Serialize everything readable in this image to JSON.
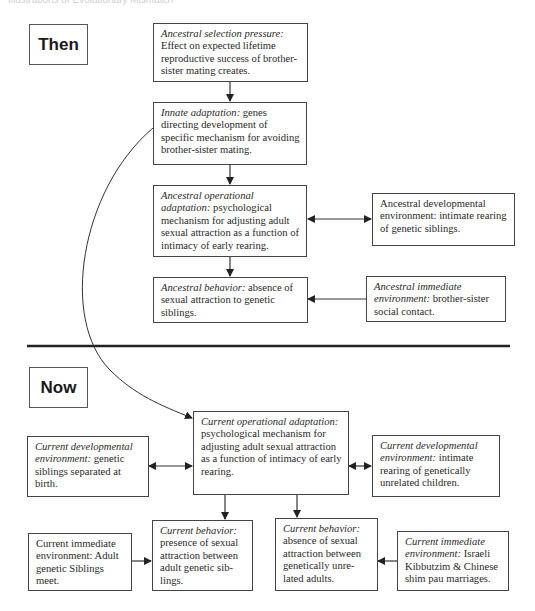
{
  "caption": "Illustrations of Evolutionary Mismatch",
  "then_label": "Then",
  "now_label": "Now",
  "then": {
    "selection_pressure": {
      "title": "Ancestral selection pressure",
      "sep": ":",
      "text": " Effect on expected lifetime reproductive success of brother-sister mating creates."
    },
    "innate_adaptation": {
      "title": "Innate adaptation",
      "sep": ":",
      "text": " genes directing development of specific mechanism for avoiding brother-sister mating."
    },
    "operational_adaptation": {
      "title": "Ancestral operational adaptation",
      "sep": ":",
      "text": " psychological mechanism for adjusting adult sexual attraction as a function of intimacy of early rearing."
    },
    "developmental_environment": {
      "title": "",
      "sep": "",
      "text": "Ancestral developmental environment: intimate rearing of genetic siblings."
    },
    "behavior": {
      "title": "Ancestral behavior",
      "sep": ":",
      "text": " absence of sexual attraction to genetic siblings."
    },
    "immediate_environment": {
      "title": "Ancestral immediate environment",
      "sep": ":",
      "text": " brother-sister social contact."
    }
  },
  "now": {
    "operational_adaptation": {
      "title": "Current operational adaptation",
      "sep": ":",
      "text": " psychological mechanism for adjusting adult sexual attraction as a function of intimacy of early rearing."
    },
    "developmental_environment_left": {
      "title": "Current developmental environment",
      "sep": ":",
      "text": " genetic siblings separated at birth."
    },
    "developmental_environment_right": {
      "title": "Current developmental environment:",
      "sep": "",
      "text": " intimate rearing of genetically unrelated children."
    },
    "behavior_left": {
      "title": "Current behavior",
      "sep": ":",
      "text": " presence of sexual attraction between adult genetic sib-lings."
    },
    "behavior_right": {
      "title": "Current behavior:",
      "sep": "",
      "text": " absence of sexual attraction between genetically unre-lated adults."
    },
    "immediate_environment_left": {
      "title": "",
      "sep": "",
      "text": "Current immediate environment: Adult genetic Siblings meet."
    },
    "immediate_environment_right": {
      "title": "Current immediate environment",
      "sep": ":",
      "text": " Israeli Kibbutzim & Chinese shim pau marriages."
    }
  },
  "colors": {
    "line": "#333333",
    "border": "#444444",
    "text": "#2a2a2a",
    "background": "#ffffff"
  }
}
